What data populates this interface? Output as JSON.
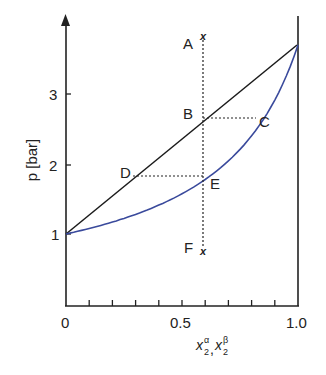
{
  "diagram": {
    "type": "phase-diagram",
    "y_axis": {
      "label": "p [bar]",
      "ticks": [
        "1",
        "2",
        "3"
      ]
    },
    "x_axis": {
      "label_main": "x",
      "sup1": "α",
      "sub": "2",
      "sep": ",",
      "sup2": "β",
      "ticks": [
        "0",
        "0.5",
        "1.0"
      ]
    },
    "points": {
      "A": "A",
      "B": "B",
      "C": "C",
      "D": "D",
      "E": "E",
      "F": "F"
    },
    "markers": {
      "top": "x",
      "bottom": "x"
    },
    "colors": {
      "liquid_line": "#1a1a1a",
      "vapor_curve": "#3a4a9c",
      "axis": "#222222"
    }
  },
  "chart_data": {
    "type": "line",
    "title": "",
    "xlabel": "x2^α, x2^β",
    "ylabel": "p [bar]",
    "xlim": [
      0,
      1.0
    ],
    "ylim": [
      0,
      4
    ],
    "x_ticks": [
      0,
      0.5,
      1.0
    ],
    "y_ticks": [
      1,
      2,
      3
    ],
    "series": [
      {
        "name": "bubble line (liquid)",
        "color": "#1a1a1a",
        "x": [
          0,
          1.0
        ],
        "y": [
          1.0,
          3.7
        ]
      },
      {
        "name": "dew curve (vapor)",
        "color": "#3a4a9c",
        "x": [
          0,
          0.2,
          0.4,
          0.6,
          0.8,
          1.0
        ],
        "y": [
          1.0,
          1.17,
          1.41,
          1.78,
          2.4,
          3.7
        ]
      }
    ],
    "annotations": [
      {
        "label": "A",
        "x": 0.6,
        "y": 3.8
      },
      {
        "label": "B",
        "x": 0.6,
        "y": 2.65
      },
      {
        "label": "C",
        "x": 0.82,
        "y": 2.65
      },
      {
        "label": "D",
        "x": 0.29,
        "y": 1.83
      },
      {
        "label": "E",
        "x": 0.6,
        "y": 1.83
      },
      {
        "label": "F",
        "x": 0.6,
        "y": 0.75
      }
    ],
    "grid": false
  }
}
